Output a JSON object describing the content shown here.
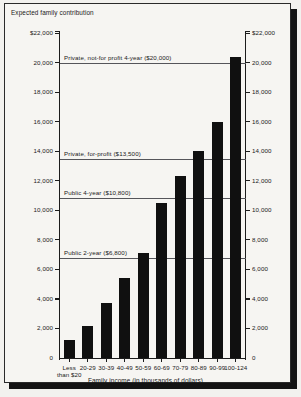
{
  "chart_data": {
    "type": "bar",
    "title": "",
    "ylabel": "Expected family contribution",
    "xlabel": "Family income (in thousands of dollars)",
    "ylim": [
      0,
      22000
    ],
    "grid": false,
    "categories": [
      "Less than $20",
      "20-29",
      "30-39",
      "40-49",
      "50-59",
      "60-69",
      "70-79",
      "80-89",
      "90-99",
      "100-124"
    ],
    "values": [
      1200,
      2200,
      3700,
      5400,
      7100,
      10500,
      12300,
      14000,
      16000,
      20400
    ],
    "y_ticks": [
      {
        "value": 22000,
        "left_label": "$22,000",
        "right_label": "$22,000"
      },
      {
        "value": 20000,
        "left_label": "20,000",
        "right_label": "20,000"
      },
      {
        "value": 18000,
        "left_label": "18,000",
        "right_label": "18,000"
      },
      {
        "value": 16000,
        "left_label": "16,000",
        "right_label": "16,000"
      },
      {
        "value": 14000,
        "left_label": "14,000",
        "right_label": "14,000"
      },
      {
        "value": 12000,
        "left_label": "12,000",
        "right_label": "12,000"
      },
      {
        "value": 10000,
        "left_label": "10,000",
        "right_label": "10,000"
      },
      {
        "value": 8000,
        "left_label": "8,000",
        "right_label": "8,000"
      },
      {
        "value": 6000,
        "left_label": "6,000",
        "right_label": "6,000"
      },
      {
        "value": 4000,
        "left_label": "4,000",
        "right_label": "4,000"
      },
      {
        "value": 2000,
        "left_label": "2,000",
        "right_label": "2,000"
      },
      {
        "value": 0,
        "left_label": "0",
        "right_label": "0"
      }
    ],
    "reference_lines": [
      {
        "value": 20000,
        "label": "Private, not-for profit 4-year ($20,000)"
      },
      {
        "value": 13500,
        "label": "Private, for-profit ($13,500)"
      },
      {
        "value": 10800,
        "label": "Public 4-year ($10,800)"
      },
      {
        "value": 6800,
        "label": "Public 2-year ($6,800)"
      }
    ],
    "colors": {
      "bar": "#101010",
      "axis": "#1c1c1c",
      "reference_line": "#55555a",
      "background": "#f6f5f2",
      "text": "#1a1a1a"
    }
  }
}
